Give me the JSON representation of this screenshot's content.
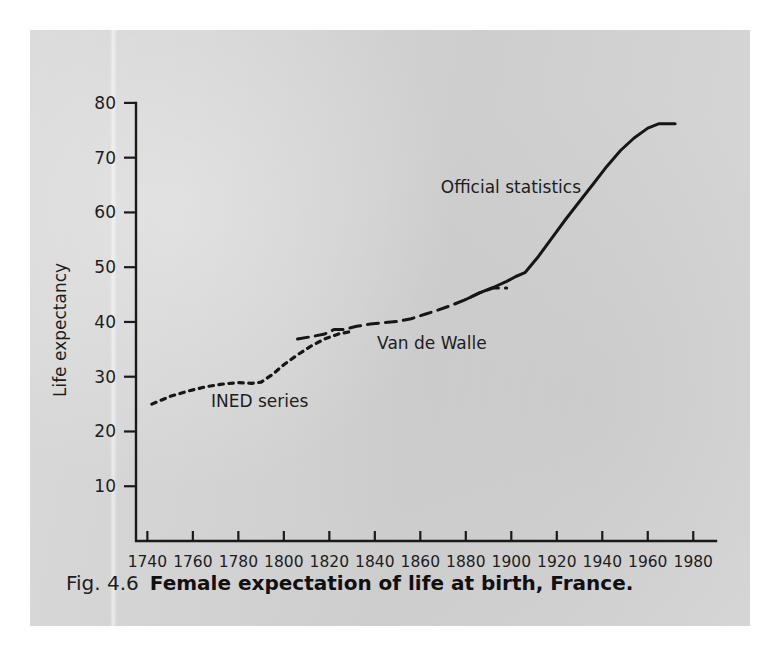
{
  "caption": {
    "figure_number": "Fig. 4.6",
    "title": "Female expectation of life at birth, France."
  },
  "chart_data": {
    "type": "line",
    "title": "Female expectation of life at birth, France.",
    "xlabel": "",
    "ylabel": "Life expectancy",
    "xlim": [
      1735,
      1990
    ],
    "ylim": [
      0,
      84
    ],
    "grid": false,
    "legend": "inline-annotations",
    "xticks": [
      1740,
      1760,
      1780,
      1800,
      1820,
      1840,
      1860,
      1880,
      1900,
      1920,
      1940,
      1960,
      1980
    ],
    "xtick_labels": [
      "1740",
      "1760",
      "1780",
      "1800",
      "1820",
      "1840",
      "1860",
      "1880",
      "1900",
      "1920",
      "1940",
      "1960",
      "1980"
    ],
    "yticks": [
      10,
      20,
      30,
      40,
      50,
      60,
      70,
      80
    ],
    "ytick_labels": [
      "10",
      "20",
      "30",
      "40",
      "50",
      "60",
      "70",
      "80"
    ],
    "series": [
      {
        "name": "INED series",
        "style": "dotted",
        "color": "#161616",
        "label_x": 1768,
        "label_y": 24.5,
        "x": [
          1742,
          1750,
          1758,
          1766,
          1774,
          1780,
          1786,
          1790,
          1795,
          1800,
          1806,
          1812,
          1818,
          1824,
          1830
        ],
        "y": [
          25.0,
          26.4,
          27.4,
          28.2,
          28.7,
          28.9,
          28.8,
          29.0,
          30.4,
          32.2,
          34.0,
          35.6,
          36.9,
          37.8,
          38.3
        ]
      },
      {
        "name": "Van de Walle",
        "style": "dashed",
        "color": "#161616",
        "label_x": 1841,
        "label_y": 35.0,
        "x": [
          1806,
          1812,
          1818,
          1822,
          1826,
          1832,
          1838,
          1844,
          1850,
          1856,
          1862,
          1868,
          1874,
          1880,
          1886,
          1892,
          1898
        ],
        "y": [
          36.9,
          37.3,
          37.8,
          38.6,
          38.6,
          39.2,
          39.6,
          39.9,
          40.1,
          40.6,
          41.4,
          42.2,
          43.1,
          44.1,
          45.3,
          46.2,
          46.2
        ]
      },
      {
        "name": "Official statistics",
        "style": "solid",
        "color": "#161616",
        "label_x": 1869,
        "label_y": 63.5,
        "x": [
          1880,
          1886,
          1892,
          1898,
          1902,
          1906,
          1912,
          1918,
          1924,
          1930,
          1936,
          1942,
          1948,
          1954,
          1960,
          1965,
          1972
        ],
        "y": [
          44.1,
          45.3,
          46.3,
          47.4,
          48.3,
          49.0,
          52.0,
          55.4,
          58.8,
          62.0,
          65.2,
          68.4,
          71.3,
          73.6,
          75.4,
          76.2,
          76.2
        ]
      }
    ]
  }
}
